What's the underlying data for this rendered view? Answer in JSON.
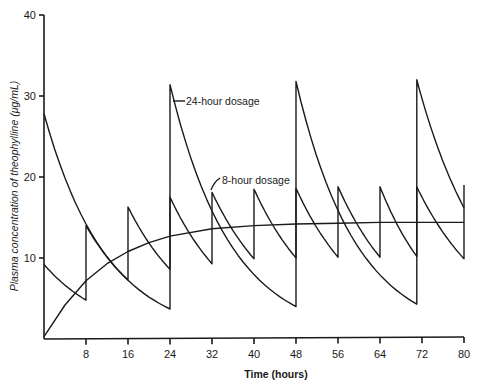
{
  "chart_data": {
    "type": "line",
    "title": "",
    "xlabel": "Time (hours)",
    "ylabel": "Plasma concentration of theophylline (μg/mL)",
    "xlim": [
      0,
      80
    ],
    "ylim": [
      0,
      40
    ],
    "x_ticks": [
      8,
      16,
      24,
      32,
      40,
      48,
      56,
      64,
      72,
      80
    ],
    "y_ticks": [
      10,
      20,
      30,
      40
    ],
    "grid": false,
    "legend": "none (inline annotations)",
    "annotations": [
      {
        "text": "24-hour dosage",
        "points_to": {
          "x": 24.5,
          "y": 28
        }
      },
      {
        "text": "8-hour dosage",
        "points_to": {
          "x": 32.2,
          "y": 18
        }
      }
    ],
    "series": [
      {
        "name": "24-hour dosage",
        "style": "sawtooth",
        "segments": [
          {
            "x0": 0,
            "y0": 27.8,
            "x1": 24,
            "y1": 3.7
          },
          {
            "x0": 24,
            "y0": 31.4,
            "x1": 48,
            "y1": 4.0
          },
          {
            "x0": 48,
            "y0": 31.8,
            "x1": 71,
            "y1": 4.3
          },
          {
            "x0": 71,
            "y0": 32.0,
            "x1": 80,
            "y1": 16.2
          }
        ]
      },
      {
        "name": "8-hour dosage",
        "style": "sawtooth",
        "segments": [
          {
            "x0": 0,
            "y0": 9.2,
            "x1": 8,
            "y1": 4.8
          },
          {
            "x0": 8,
            "y0": 14.0,
            "x1": 16,
            "y1": 7.3
          },
          {
            "x0": 16,
            "y0": 16.3,
            "x1": 24,
            "y1": 8.6
          },
          {
            "x0": 24,
            "y0": 17.5,
            "x1": 32,
            "y1": 9.3
          },
          {
            "x0": 32,
            "y0": 18.1,
            "x1": 40,
            "y1": 9.9
          },
          {
            "x0": 40,
            "y0": 18.5,
            "x1": 48,
            "y1": 10.0
          },
          {
            "x0": 48,
            "y0": 18.6,
            "x1": 56,
            "y1": 10.1
          },
          {
            "x0": 56,
            "y0": 18.8,
            "x1": 64,
            "y1": 10.1
          },
          {
            "x0": 64,
            "y0": 18.8,
            "x1": 71,
            "y1": 10.2
          },
          {
            "x0": 71,
            "y0": 18.8,
            "x1": 80,
            "y1": 9.9
          },
          {
            "x0": 80,
            "y0": 19.0,
            "x1": 80,
            "y1": 19.0
          }
        ]
      },
      {
        "name": "Continuous infusion (unlabeled)",
        "style": "smooth",
        "x": [
          0,
          4,
          8,
          12,
          16,
          20,
          24,
          32,
          40,
          48,
          56,
          64,
          72,
          80
        ],
        "values": [
          0.3,
          4.2,
          7.2,
          9.3,
          10.8,
          11.9,
          12.7,
          13.6,
          14.0,
          14.2,
          14.3,
          14.4,
          14.4,
          14.4
        ]
      }
    ]
  }
}
